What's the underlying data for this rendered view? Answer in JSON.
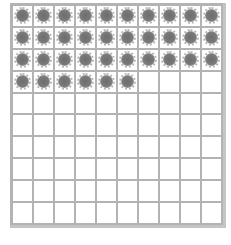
{
  "grid": {
    "rows": 10,
    "columns": 10,
    "total_cells": 100,
    "filled_cells": 36,
    "fill_color": "#6d6d6d",
    "line_color": "#b3b3b3",
    "icon": "sun-dot-icon"
  }
}
